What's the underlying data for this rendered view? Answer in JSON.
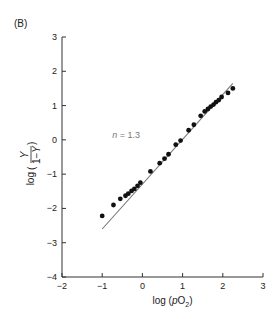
{
  "panel_label": "(B)",
  "chart_data": {
    "type": "scatter",
    "title": "",
    "panel": "(B)",
    "xlabel": "log (pO₂)",
    "ylabel": "log (Y / (1−Y))",
    "xlim": [
      -2,
      3
    ],
    "ylim": [
      -4,
      3
    ],
    "xticks": [
      -2,
      -1,
      0,
      1,
      2,
      3
    ],
    "yticks": [
      -4,
      -3,
      -2,
      -1,
      0,
      1,
      2,
      3
    ],
    "grid": false,
    "legend": null,
    "annotations": [
      {
        "text": "n = 1.3",
        "x": -0.5,
        "y": 0.05
      }
    ],
    "series": [
      {
        "name": "data",
        "style": "points",
        "color": "#111111",
        "points": [
          [
            -1.0,
            -2.22
          ],
          [
            -0.72,
            -1.9
          ],
          [
            -0.55,
            -1.72
          ],
          [
            -0.42,
            -1.63
          ],
          [
            -0.35,
            -1.57
          ],
          [
            -0.27,
            -1.49
          ],
          [
            -0.2,
            -1.43
          ],
          [
            -0.12,
            -1.34
          ],
          [
            -0.05,
            -1.25
          ],
          [
            0.2,
            -0.92
          ],
          [
            0.43,
            -0.68
          ],
          [
            0.55,
            -0.55
          ],
          [
            0.65,
            -0.42
          ],
          [
            0.83,
            -0.14
          ],
          [
            0.95,
            -0.02
          ],
          [
            1.15,
            0.28
          ],
          [
            1.28,
            0.44
          ],
          [
            1.45,
            0.7
          ],
          [
            1.55,
            0.83
          ],
          [
            1.63,
            0.9
          ],
          [
            1.7,
            0.97
          ],
          [
            1.77,
            1.03
          ],
          [
            1.83,
            1.1
          ],
          [
            1.9,
            1.16
          ],
          [
            1.97,
            1.25
          ],
          [
            2.13,
            1.37
          ],
          [
            2.25,
            1.5
          ]
        ]
      },
      {
        "name": "fit n = 1.3",
        "style": "line",
        "color": "#777777",
        "points": [
          [
            -1.0,
            -2.6
          ],
          [
            2.25,
            1.65
          ]
        ]
      }
    ]
  }
}
